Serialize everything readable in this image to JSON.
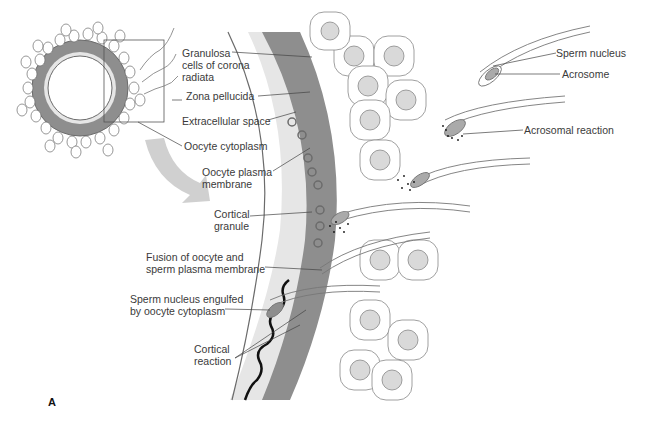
{
  "figure": {
    "panel_label": "A",
    "colors": {
      "zona": "#8e8e8e",
      "extracellular": "#e6e6e6",
      "cell_fill": "#ffffff",
      "nucleus": "#d9d9d9",
      "outline": "#6b6b6b",
      "arrow": "#d0d0d0",
      "cortical_reaction": "#111111"
    },
    "labels": {
      "granulosa": "Granulosa\ncells of corona\nradiata",
      "zona_pellucida": "Zona pellucida",
      "extracellular_space": "Extracellular space",
      "oocyte_cytoplasm": "Oocyte cytoplasm",
      "oocyte_plasma_membrane": "Oocyte plasma\nmembrane",
      "cortical_granule": "Cortical\ngranule",
      "fusion": "Fusion of oocyte and\nsperm plasma membrane",
      "sperm_engulfed": "Sperm nucleus engulfed\nby oocyte cytoplasm",
      "cortical_reaction": "Cortical\nreaction",
      "sperm_nucleus": "Sperm nucleus",
      "acrosome": "Acrosome",
      "acrosomal_reaction": "Acrosomal reaction"
    }
  }
}
